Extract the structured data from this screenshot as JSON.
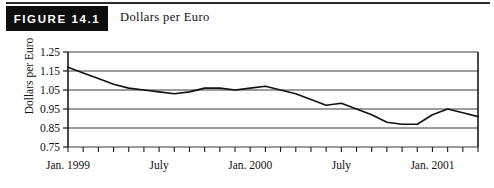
{
  "figure": {
    "badge_label": "FIGURE 14.1",
    "title": "Dollars per Euro"
  },
  "chart_data": {
    "type": "line",
    "title": "Dollars per Euro",
    "xlabel": "",
    "ylabel": "Dollars per Euro",
    "ylim": [
      0.75,
      1.25
    ],
    "ytick_labels": [
      "1.25",
      "1.15",
      "1.05",
      "0.95",
      "0.85",
      "0.75"
    ],
    "ytick_values": [
      1.25,
      1.15,
      1.05,
      0.95,
      0.85,
      0.75
    ],
    "xtick_labels": [
      "Jan. 1999",
      "July",
      "Jan. 2000",
      "July",
      "Jan. 2001"
    ],
    "xtick_values": [
      "1999-01",
      "1999-07",
      "2000-01",
      "2000-07",
      "2001-01"
    ],
    "grid": true,
    "legend": "none",
    "minor_ticks": "monthly",
    "series": [
      {
        "name": "Dollars per Euro",
        "x": [
          "1999-01",
          "1999-02",
          "1999-03",
          "1999-04",
          "1999-05",
          "1999-06",
          "1999-07",
          "1999-08",
          "1999-09",
          "1999-10",
          "1999-11",
          "1999-12",
          "2000-01",
          "2000-02",
          "2000-03",
          "2000-04",
          "2000-05",
          "2000-06",
          "2000-07",
          "2000-08",
          "2000-09",
          "2000-10",
          "2000-11",
          "2000-12",
          "2001-01",
          "2001-02",
          "2001-03",
          "2001-04"
        ],
        "values": [
          1.17,
          1.14,
          1.11,
          1.08,
          1.06,
          1.05,
          1.04,
          1.03,
          1.04,
          1.06,
          1.06,
          1.05,
          1.06,
          1.07,
          1.05,
          1.03,
          1.0,
          0.97,
          0.98,
          0.95,
          0.92,
          0.88,
          0.87,
          0.87,
          0.92,
          0.95,
          0.93,
          0.91
        ]
      }
    ]
  },
  "colors": {
    "badge_background": "#0e0e0e",
    "badge_text": "#ffffff",
    "axis": "#1a1a1a",
    "grid": "#3a3a3a",
    "data_line": "#111111",
    "page_background": "#ffffff"
  }
}
